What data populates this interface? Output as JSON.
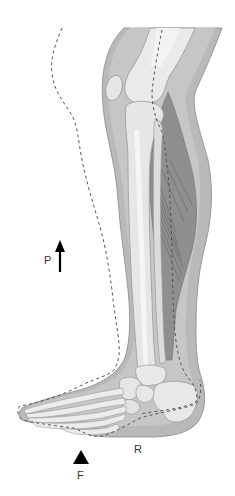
{
  "diagram": {
    "view": "lateral view of lower leg, ankle and foot",
    "top_text_cropped": "",
    "labels": {
      "p": "P",
      "f": "F",
      "r": "R"
    },
    "symbols": {
      "p_arrow": "arrow-up",
      "f_marker": "filled-triangle-up"
    },
    "outlines": {
      "dashed_outline": "previous limb contour (dashed)",
      "dashed_axis": "bone axis line (dashed)"
    },
    "structures": [
      "femur",
      "patella",
      "tibia",
      "fibula",
      "calf-muscle",
      "tarsals",
      "calcaneus",
      "metatarsals",
      "phalanges",
      "soft-tissue"
    ],
    "colors": {
      "background": "#ffffff",
      "soft_tissue": "#b9b9b9",
      "soft_tissue_light": "#cdcdcd",
      "muscle": "#8f8f8f",
      "muscle_fiber": "#6f6f6f",
      "bone": "#eaeaea",
      "bone_shade": "#d6d6d6",
      "outline": "#7a7a7a",
      "dash": "#555555",
      "marker": "#000000",
      "label": "#333333"
    }
  }
}
